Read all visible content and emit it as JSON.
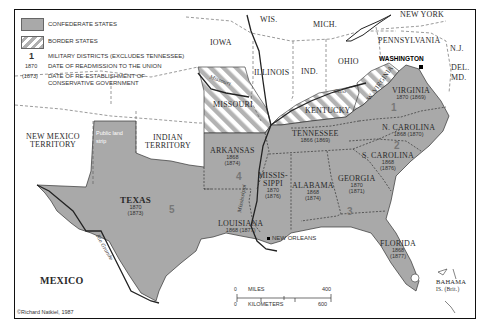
{
  "legend": {
    "confederate_label": "CONFEDERATE STATES",
    "border_label": "BORDER STATES",
    "district_symbol": "1",
    "district_label": "MILITARY DISTRICTS (EXCLUDES TENNESSEE)",
    "readmission_symbol": "1870",
    "readmission_label": "DATE OF READMISSION TO THE UNION",
    "conservative_symbol": "(1873)",
    "conservative_label_line1": "DATE OF RE-ESTABLISHMENT OF",
    "conservative_label_line2": "CONSERVATIVE GOVERNMENT"
  },
  "colors": {
    "confederate": "#a9a9a9",
    "border_stripe": "#b0b0b0",
    "land": "#ffffff",
    "boundary": "#333333",
    "district_number": "#7a7a7a"
  },
  "northern_states": {
    "wis": "WIS.",
    "mich": "MICH.",
    "iowa": "IOWA",
    "illinois": "ILLINOIS",
    "ind": "IND.",
    "ohio": "OHIO",
    "new_york": "NEW YORK",
    "pennsylvania": "PENNSYLVANIA",
    "nj": "N.J.",
    "del": "DEL.",
    "md": "MD."
  },
  "border_states": {
    "missouri": "MISSOURI",
    "kentucky": "KENTUCKY",
    "west_virginia": "W. VIRGINIA"
  },
  "territories": {
    "new_mexico_1": "NEW MEXICO",
    "new_mexico_2": "TERRITORY",
    "indian_1": "INDIAN",
    "indian_2": "TERRITORY",
    "public_land_1": "Public land",
    "public_land_2": "strip"
  },
  "confederate_states": [
    {
      "name": "VIRGINIA",
      "readmitted": "1870",
      "conservative": "(1869)"
    },
    {
      "name": "N. CAROLINA",
      "readmitted": "1868",
      "conservative": "(1870)"
    },
    {
      "name": "S. CAROLINA",
      "readmitted": "1868",
      "conservative": "(1876)"
    },
    {
      "name": "TENNESSEE",
      "readmitted": "1866",
      "conservative": "(1869)"
    },
    {
      "name": "GEORGIA",
      "readmitted": "1870",
      "conservative": "(1871)"
    },
    {
      "name": "ALABAMA",
      "readmitted": "1868",
      "conservative": "(1874)"
    },
    {
      "name": "MISSIS-",
      "name2": "SIPPI",
      "readmitted": "1870",
      "conservative": "(1876)"
    },
    {
      "name": "ARKANSAS",
      "readmitted": "1868",
      "conservative": "(1874)"
    },
    {
      "name": "LOUISIANA",
      "readmitted": "1868",
      "conservative": "(1877)"
    },
    {
      "name": "TEXAS",
      "readmitted": "1870",
      "conservative": "(1873)"
    },
    {
      "name": "FLORIDA",
      "readmitted": "1868",
      "conservative": "(1877)"
    }
  ],
  "military_districts": [
    "1",
    "2",
    "3",
    "4",
    "5"
  ],
  "places": {
    "washington": "WASHINGTON",
    "new_orleans": "NEW ORLEANS",
    "mexico": "MEXICO",
    "bahama_1": "BAHAMA",
    "bahama_2": "IS. (Brit.)"
  },
  "rivers": {
    "missouri": "Missouri",
    "mississippi": "Mississippi",
    "ohio": "Ohio",
    "rio_grande": "Rio Grande"
  },
  "scale": {
    "miles_label": "MILES",
    "km_label": "KILOMETERS",
    "zero_miles": "0",
    "zero_km": "0",
    "max_miles": "400",
    "max_km": "600"
  },
  "credit": "©Richard Natkiel, 1987"
}
